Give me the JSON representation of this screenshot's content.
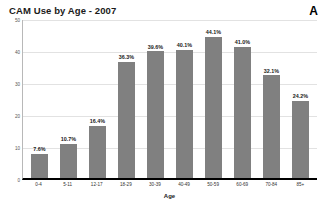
{
  "chart_data": {
    "type": "bar",
    "title": "CAM Use by Age - 2007",
    "panel_label": "A",
    "xlabel": "Age",
    "ylabel": "",
    "categories": [
      "0-4",
      "5-11",
      "12-17",
      "18-29",
      "30-39",
      "40-49",
      "50-59",
      "60-69",
      "70-84",
      "85+"
    ],
    "values": [
      7.6,
      10.7,
      16.4,
      36.3,
      39.6,
      40.1,
      44.1,
      41.0,
      32.1,
      24.2
    ],
    "data_labels": [
      "7.6%",
      "10.7%",
      "16.4%",
      "36.3%",
      "39.6%",
      "40.1%",
      "44.1%",
      "41.0%",
      "32.1%",
      "24.2%"
    ],
    "ylim": [
      0,
      50
    ],
    "yticks": [
      0,
      10,
      20,
      30,
      40,
      50
    ],
    "ytick_labels": [
      "0",
      "10",
      "20",
      "30",
      "40",
      "50"
    ],
    "grid": true,
    "legend": false,
    "bar_color": "#808080",
    "axis_color": "#000000",
    "grid_color": "#e2e2e2",
    "background": "#ffffff"
  }
}
